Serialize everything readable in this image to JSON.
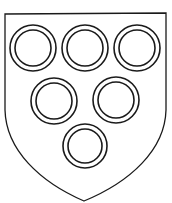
{
  "image": {
    "description": "Heraldic shield (escutcheon) charged with six annulets arranged 3, 2, 1",
    "background": "#ffffff",
    "line_color": "#1a1a1a"
  },
  "shield": {
    "shape": "heater",
    "field_color": "#ffffff",
    "outline_color": "#1a1a1a"
  },
  "charges": {
    "type": "annulet",
    "count": 6,
    "arrangement": "3, 2, 1",
    "rings": [
      {
        "cx": 33,
        "cy": 48,
        "r_outer": 23,
        "r_inner": 18
      },
      {
        "cx": 85,
        "cy": 48,
        "r_outer": 23,
        "r_inner": 18
      },
      {
        "cx": 137,
        "cy": 48,
        "r_outer": 23,
        "r_inner": 18
      },
      {
        "cx": 54,
        "cy": 101,
        "r_outer": 23,
        "r_inner": 18
      },
      {
        "cx": 116,
        "cy": 100,
        "r_outer": 23,
        "r_inner": 18
      },
      {
        "cx": 85,
        "cy": 146,
        "r_outer": 22,
        "r_inner": 17
      }
    ]
  }
}
